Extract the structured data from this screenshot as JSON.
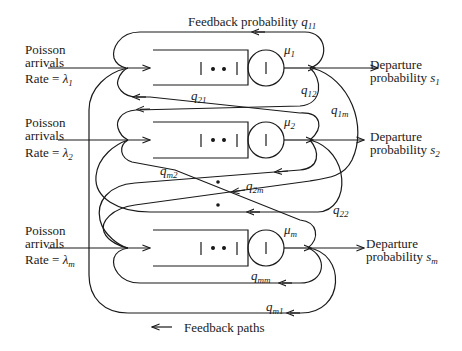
{
  "diagram": {
    "colors": {
      "stroke": "#1a1a1a",
      "background": "#ffffff"
    },
    "queues": [
      {
        "id": "1",
        "arrival_line1": "Poisson",
        "arrival_line2": "arrivals",
        "rate_prefix": "Rate = ",
        "rate_symbol": "λ",
        "rate_sub": "1",
        "service_symbol": "μ",
        "service_sub": "1",
        "departure_line1": "Departure",
        "departure_line2_prefix": "probability ",
        "departure_symbol": "s",
        "departure_sub": "1"
      },
      {
        "id": "2",
        "arrival_line1": "Poisson",
        "arrival_line2": "arrivals",
        "rate_prefix": "Rate = ",
        "rate_symbol": "λ",
        "rate_sub": "2",
        "service_symbol": "μ",
        "service_sub": "2",
        "departure_line1": "Departure",
        "departure_line2_prefix": "probability ",
        "departure_symbol": "s",
        "departure_sub": "2"
      },
      {
        "id": "m",
        "arrival_line1": "Poisson",
        "arrival_line2": "arrivals",
        "rate_prefix": "Rate = ",
        "rate_symbol": "λ",
        "rate_sub": "m",
        "service_symbol": "μ",
        "service_sub": "m",
        "departure_line1": "Departure",
        "departure_line2_prefix": "probability ",
        "departure_symbol": "s",
        "departure_sub": "m"
      }
    ],
    "feedback_labels": {
      "q11_prefix": "Feedback probability ",
      "q11": {
        "symbol": "q",
        "sub": "11"
      },
      "q12": {
        "symbol": "q",
        "sub": "12"
      },
      "q1m": {
        "symbol": "q",
        "sub": "1m"
      },
      "q21": {
        "symbol": "q",
        "sub": "21"
      },
      "q22": {
        "symbol": "q",
        "sub": "22"
      },
      "q2m": {
        "symbol": "q",
        "sub": "2m"
      },
      "qm2": {
        "symbol": "q",
        "sub": "m2"
      },
      "qmm": {
        "symbol": "q",
        "sub": "mm"
      },
      "qm1": {
        "symbol": "q",
        "sub": "m1"
      }
    },
    "queue_glyph": "| • • |",
    "server_glyph": "|",
    "ellipsis_dots": "•",
    "legend": {
      "arrow": "←",
      "text": "Feedback paths"
    }
  }
}
